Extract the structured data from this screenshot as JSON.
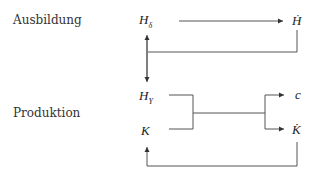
{
  "rows": {
    "education": {
      "label": "Ausbildung"
    },
    "production": {
      "label": "Produktion"
    }
  },
  "nodes": {
    "h_delta": {
      "base": "H",
      "sub": "δ"
    },
    "h_dot": {
      "text": "Ḣ"
    },
    "h_y": {
      "base": "H",
      "sub": "Y"
    },
    "k": {
      "text": "K"
    },
    "c": {
      "text": "c"
    },
    "k_dot": {
      "text": "K̇"
    }
  },
  "colors": {
    "line": "#444444",
    "text": "#222222"
  }
}
